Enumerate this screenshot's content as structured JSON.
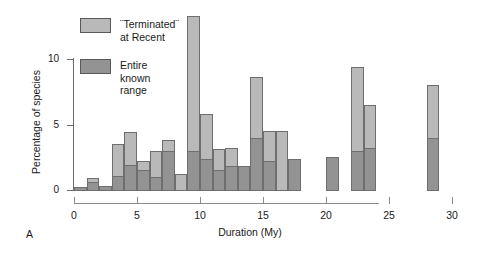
{
  "figure": {
    "panel_label": "A"
  },
  "legend": {
    "position": "top-left-inside",
    "items": [
      {
        "label": "¨Terminated¨\nat Recent",
        "color": "#b9b9b9",
        "key": "terminated_at_recent"
      },
      {
        "label": "Entire known\nrange",
        "color": "#939393",
        "key": "entire_known_range"
      }
    ]
  },
  "chart_data": {
    "type": "bar",
    "subtype": "stacked-histogram",
    "title": "",
    "xlabel": "Duration (My)",
    "ylabel": "Percentage of species",
    "xlim": [
      0,
      30
    ],
    "ylim": [
      0,
      14
    ],
    "xticks": [
      0,
      5,
      10,
      15,
      20,
      25,
      30
    ],
    "xtick_labels": [
      "0",
      "5",
      "10",
      "15",
      "20",
      "25",
      "30"
    ],
    "yticks": [
      0,
      5,
      10
    ],
    "ytick_labels": [
      "0",
      "5",
      "10"
    ],
    "grid": false,
    "bin_width": 1,
    "bin_starts": [
      0,
      1,
      2,
      3,
      4,
      5,
      6,
      7,
      8,
      9,
      10,
      11,
      12,
      13,
      14,
      15,
      16,
      17,
      18,
      19,
      20,
      21,
      22,
      23,
      24,
      25,
      26,
      27,
      28,
      29
    ],
    "series": [
      {
        "name": "Entire known range",
        "color": "#939393",
        "values": [
          0.2,
          0.6,
          0.3,
          1.1,
          1.9,
          1.5,
          1.0,
          3.0,
          0.0,
          3.0,
          2.4,
          1.5,
          1.8,
          1.8,
          4.0,
          2.2,
          0.0,
          2.4,
          0.0,
          0.0,
          2.5,
          0.0,
          3.0,
          3.2,
          0.0,
          0.0,
          0.0,
          0.0,
          4.0,
          0.0
        ]
      },
      {
        "name": "¨Terminated¨ at Recent",
        "color": "#b9b9b9",
        "values": [
          0.0,
          0.3,
          0.0,
          2.4,
          2.5,
          0.7,
          2.0,
          0.8,
          1.2,
          10.3,
          3.4,
          1.6,
          1.4,
          0.0,
          4.6,
          2.3,
          4.5,
          0.0,
          0.0,
          0.0,
          0.0,
          0.0,
          6.4,
          3.3,
          0.0,
          0.0,
          0.0,
          0.0,
          4.0,
          0.0
        ]
      }
    ],
    "totals": [
      0.2,
      0.9,
      0.3,
      3.5,
      4.4,
      2.2,
      3.0,
      3.8,
      1.2,
      13.3,
      5.8,
      3.1,
      3.2,
      1.8,
      8.6,
      4.5,
      4.5,
      2.4,
      0.0,
      0.0,
      2.5,
      0.0,
      9.4,
      6.5,
      0.0,
      0.0,
      0.0,
      0.0,
      8.0,
      0.0
    ]
  }
}
